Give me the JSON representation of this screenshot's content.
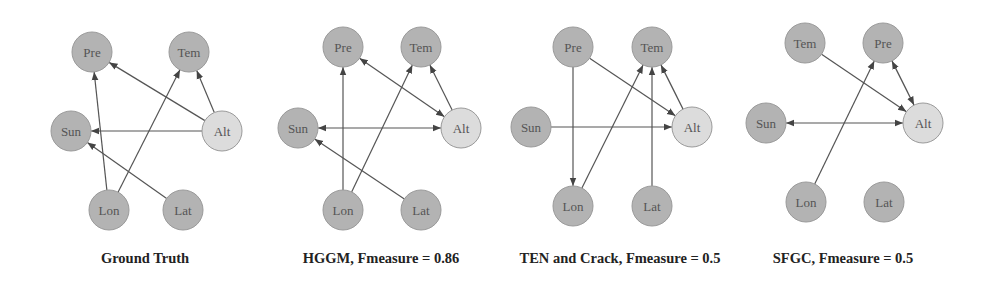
{
  "colors": {
    "node_fill": "#b3b3b3",
    "node_fill_highlight": "#dcdcdc",
    "node_stroke": "#9a9a9a",
    "edge": "#555555",
    "label": "#555555"
  },
  "graphs": [
    {
      "caption": "Ground Truth",
      "offset_x": 0,
      "nodes": {
        "Pre": [
          92,
          52
        ],
        "Tem": [
          189,
          52
        ],
        "Sun": [
          71,
          131
        ],
        "Alt": [
          222,
          131
        ],
        "Lon": [
          109,
          210
        ],
        "Lat": [
          183,
          210
        ]
      },
      "edges": [
        {
          "from": "Lon",
          "to": "Pre",
          "type": "directed"
        },
        {
          "from": "Lon",
          "to": "Tem",
          "type": "directed"
        },
        {
          "from": "Alt",
          "to": "Pre",
          "type": "directed"
        },
        {
          "from": "Alt",
          "to": "Tem",
          "type": "directed"
        },
        {
          "from": "Alt",
          "to": "Sun",
          "type": "directed"
        },
        {
          "from": "Lat",
          "to": "Sun",
          "type": "directed"
        }
      ]
    },
    {
      "caption": "HGGM, Fmeasure = 0.86",
      "offset_x": 0,
      "nodes": {
        "Pre": [
          343,
          47
        ],
        "Tem": [
          421,
          47
        ],
        "Sun": [
          298,
          128
        ],
        "Alt": [
          461,
          128
        ],
        "Lon": [
          343,
          210
        ],
        "Lat": [
          421,
          210
        ]
      },
      "edges": [
        {
          "from": "Lon",
          "to": "Pre",
          "type": "directed"
        },
        {
          "from": "Lon",
          "to": "Tem",
          "type": "directed"
        },
        {
          "from": "Pre",
          "to": "Alt",
          "type": "bidirected"
        },
        {
          "from": "Alt",
          "to": "Tem",
          "type": "directed"
        },
        {
          "from": "Sun",
          "to": "Alt",
          "type": "bidirected"
        },
        {
          "from": "Lat",
          "to": "Sun",
          "type": "directed"
        }
      ]
    },
    {
      "caption": "TEN and Crack, Fmeasure = 0.5",
      "offset_x": 0,
      "nodes": {
        "Pre": [
          573,
          47
        ],
        "Tem": [
          652,
          47
        ],
        "Sun": [
          531,
          127
        ],
        "Alt": [
          692,
          127
        ],
        "Lon": [
          573,
          206
        ],
        "Lat": [
          652,
          206
        ]
      },
      "edges": [
        {
          "from": "Pre",
          "to": "Lon",
          "type": "directed"
        },
        {
          "from": "Pre",
          "to": "Alt",
          "type": "directed"
        },
        {
          "from": "Lon",
          "to": "Tem",
          "type": "directed"
        },
        {
          "from": "Lat",
          "to": "Tem",
          "type": "directed"
        },
        {
          "from": "Alt",
          "to": "Tem",
          "type": "directed"
        },
        {
          "from": "Sun",
          "to": "Alt",
          "type": "directed"
        }
      ]
    },
    {
      "caption": "SFGC, Fmeasure = 0.5",
      "offset_x": 0,
      "nodes": {
        "Tem": [
          805,
          43
        ],
        "Pre": [
          883,
          43
        ],
        "Sun": [
          766,
          123
        ],
        "Alt": [
          923,
          123
        ],
        "Lon": [
          806,
          202
        ],
        "Lat": [
          884,
          202
        ]
      },
      "edges": [
        {
          "from": "Tem",
          "to": "Alt",
          "type": "directed"
        },
        {
          "from": "Lon",
          "to": "Pre",
          "type": "directed"
        },
        {
          "from": "Pre",
          "to": "Alt",
          "type": "bidirected"
        },
        {
          "from": "Sun",
          "to": "Alt",
          "type": "bidirected"
        }
      ]
    }
  ],
  "captions": {
    "ground_truth": "Ground Truth",
    "hggm": "HGGM, Fmeasure = 0.86",
    "ten_crack": "TEN and Crack, Fmeasure = 0.5",
    "sfgc": "SFGC, Fmeasure = 0.5"
  }
}
